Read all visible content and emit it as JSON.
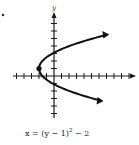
{
  "figure": {
    "item_marker": "•",
    "x_axis_label": "x",
    "y_axis_label": "y",
    "caption": {
      "lhs": "x = (y − 1)",
      "exponent": "2",
      "rhs": " − 2"
    },
    "equation": "x = (y - 1)^2 - 2",
    "vertex": [
      -2,
      1
    ],
    "x_range": [
      -6,
      10
    ],
    "y_range": [
      -6,
      8
    ],
    "x_ticks": [
      -5,
      -4,
      -3,
      -2,
      -1,
      1,
      2,
      3,
      4,
      5,
      6,
      7,
      8,
      9,
      10
    ],
    "y_ticks": [
      -5,
      -4,
      -3,
      -2,
      -1,
      1,
      2,
      3,
      4,
      5,
      6,
      7
    ],
    "curve_y_range": [
      -3.2,
      5.4
    ],
    "colors": {
      "ink": "#111111",
      "background": "#ffffff"
    }
  }
}
